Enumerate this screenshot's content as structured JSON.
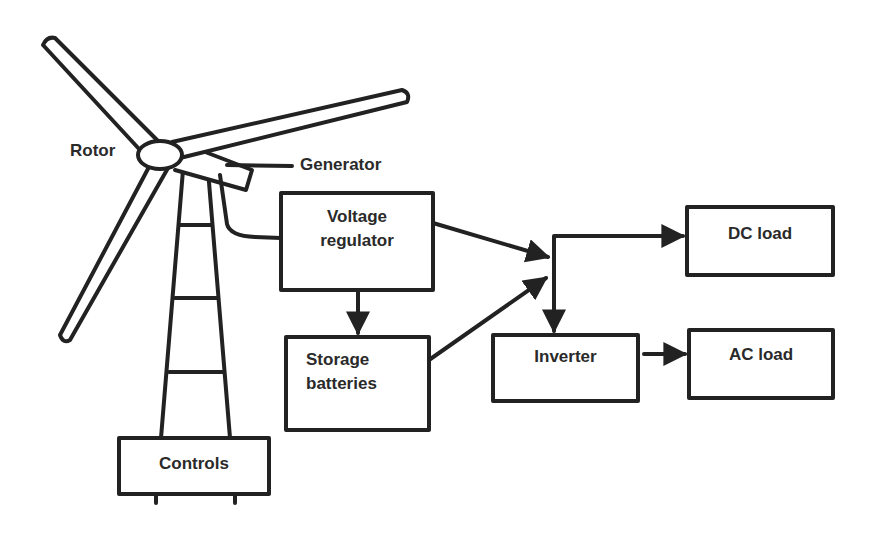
{
  "colors": {
    "stroke": "#222222",
    "text": "#2a2a2a",
    "background": "#ffffff"
  },
  "labels": {
    "rotor": "Rotor",
    "generator": "Generator"
  },
  "boxes": {
    "voltage_regulator": {
      "line1": "Voltage",
      "line2": "regulator"
    },
    "storage_batteries": {
      "line1": "Storage",
      "line2": "batteries"
    },
    "inverter": {
      "label": "Inverter"
    },
    "dc_load": {
      "label": "DC load"
    },
    "ac_load": {
      "label": "AC load"
    },
    "controls": {
      "label": "Controls"
    }
  },
  "connections": [
    {
      "from": "Generator",
      "to": "Voltage regulator"
    },
    {
      "from": "Voltage regulator",
      "to": "Storage batteries"
    },
    {
      "from": "Voltage regulator",
      "to": "junction"
    },
    {
      "from": "Storage batteries",
      "to": "junction"
    },
    {
      "from": "junction",
      "to": "DC load"
    },
    {
      "from": "junction",
      "to": "Inverter"
    },
    {
      "from": "Inverter",
      "to": "AC load"
    }
  ]
}
